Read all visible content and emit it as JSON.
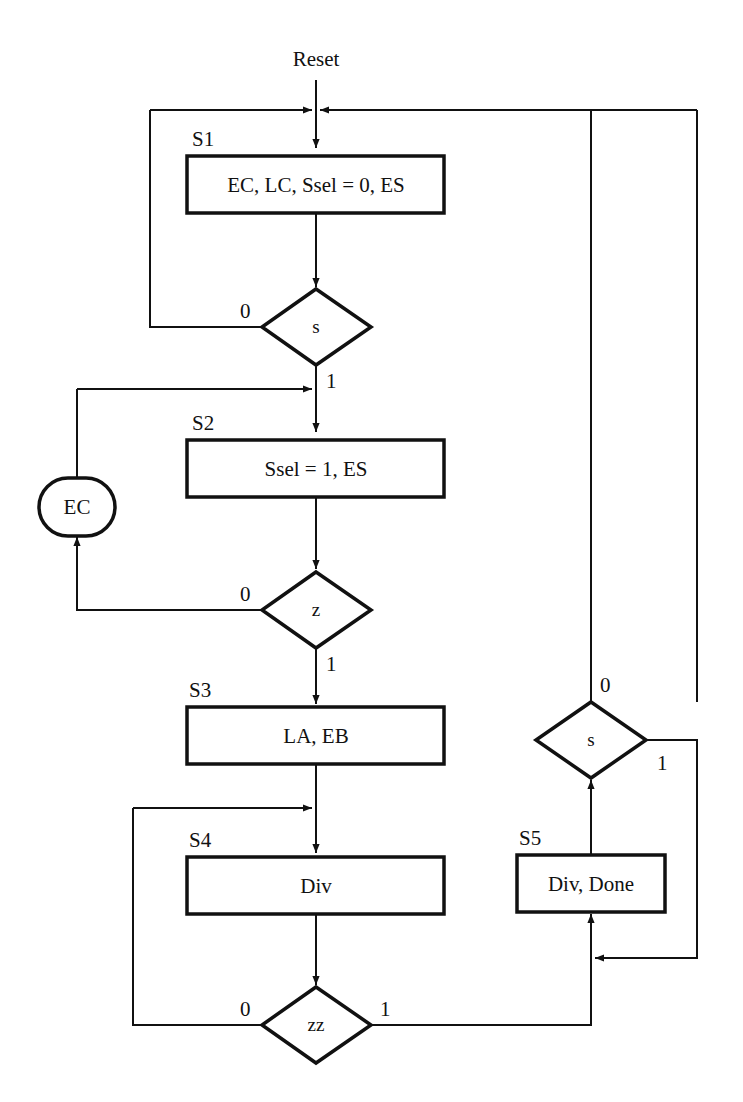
{
  "diagram": {
    "type": "ASM flowchart",
    "entry_label": "Reset",
    "colors": {
      "stroke": "#111111",
      "background": "#ffffff"
    },
    "states": [
      {
        "id": "S1",
        "label": "S1",
        "actions": "EC, LC, Ssel = 0, ES"
      },
      {
        "id": "S2",
        "label": "S2",
        "actions": "Ssel = 1, ES"
      },
      {
        "id": "S3",
        "label": "S3",
        "actions": "LA, EB"
      },
      {
        "id": "S4",
        "label": "S4",
        "actions": "Div"
      },
      {
        "id": "S5",
        "label": "S5",
        "actions": "Div, Done"
      }
    ],
    "decisions": [
      {
        "id": "d1",
        "condition": "s",
        "false_label": "0",
        "true_label": "1"
      },
      {
        "id": "d2",
        "condition": "z",
        "false_label": "0",
        "true_label": "1"
      },
      {
        "id": "d3",
        "condition": "zz",
        "false_label": "0",
        "true_label": "1"
      },
      {
        "id": "d4",
        "condition": "s",
        "false_label": "0",
        "true_label": "1"
      }
    ],
    "conditional_outputs": [
      {
        "id": "c1",
        "label": "EC"
      }
    ],
    "transitions": [
      {
        "from": "Reset",
        "to": "S1"
      },
      {
        "from": "S1",
        "to": "d1"
      },
      {
        "from": "d1",
        "to": "S1",
        "on": "0"
      },
      {
        "from": "d1",
        "to": "S2",
        "on": "1"
      },
      {
        "from": "S2",
        "to": "d2"
      },
      {
        "from": "d2",
        "to": "c1",
        "on": "0"
      },
      {
        "from": "c1",
        "to": "S2"
      },
      {
        "from": "d2",
        "to": "S3",
        "on": "1"
      },
      {
        "from": "S3",
        "to": "S4"
      },
      {
        "from": "S4",
        "to": "d3"
      },
      {
        "from": "d3",
        "to": "S4",
        "on": "0"
      },
      {
        "from": "d3",
        "to": "S5",
        "on": "1"
      },
      {
        "from": "S5",
        "to": "d4"
      },
      {
        "from": "d4",
        "to": "S1",
        "on": "0"
      },
      {
        "from": "d4",
        "to": "S5",
        "on": "1"
      }
    ]
  }
}
